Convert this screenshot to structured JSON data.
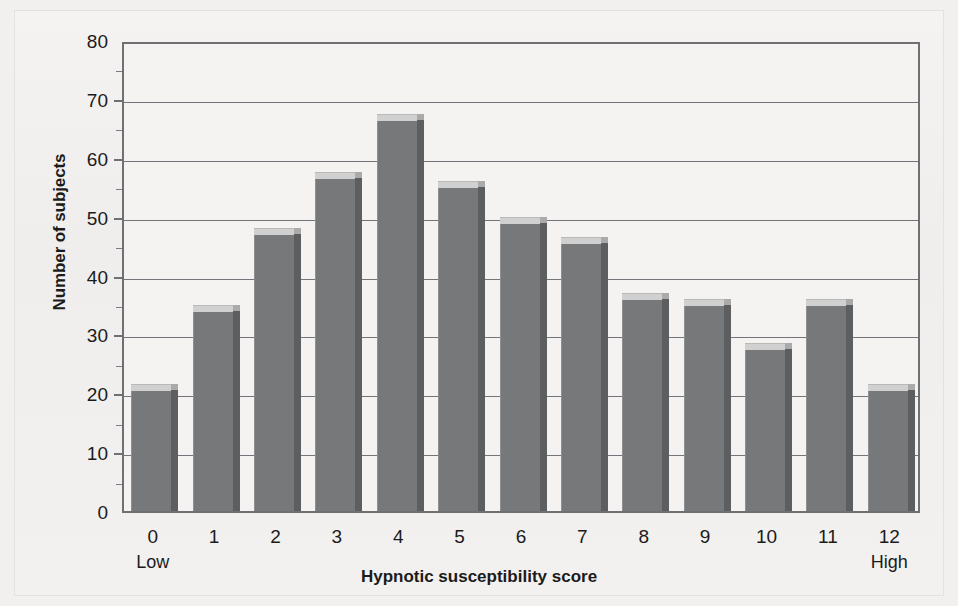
{
  "figure": {
    "background_color": "#f1f0ee",
    "plot_background_color": "#f4f3f1",
    "axis_color": "#6f7073",
    "bar_color": "#77787a",
    "bar_top_color": "#cfd0cf",
    "bar_side_color": "#5d5e60"
  },
  "chart_data": {
    "type": "bar",
    "title": "",
    "xlabel": "Hypnotic susceptibility score",
    "ylabel": "Number of subjects",
    "categories": [
      "0",
      "1",
      "2",
      "3",
      "4",
      "5",
      "6",
      "7",
      "8",
      "9",
      "10",
      "11",
      "12"
    ],
    "values": [
      21.5,
      35,
      48,
      57.5,
      67.5,
      56,
      50,
      46.5,
      37,
      36,
      28.5,
      36,
      21.5
    ],
    "ylim": [
      0,
      80
    ],
    "ytick_values": [
      0,
      10,
      20,
      30,
      40,
      50,
      60,
      70,
      80
    ],
    "ytick_labels": [
      "0",
      "10",
      "20",
      "30",
      "40",
      "50",
      "60",
      "70",
      "80"
    ],
    "grid": true,
    "grid_axis": "y",
    "legend": null,
    "legend_position": "none",
    "annotations": [
      {
        "text": "Low",
        "under_category": "0"
      },
      {
        "text": "High",
        "under_category": "12"
      }
    ]
  }
}
